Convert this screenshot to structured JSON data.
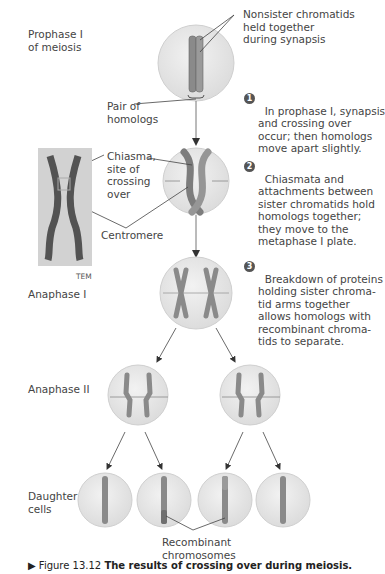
{
  "stages": {
    "prophase": "Prophase I\nof meiosis",
    "anaphase1": "Anaphase I",
    "anaphase2": "Anaphase II",
    "daughter": "Daughter\ncells"
  },
  "labels": {
    "nonsister": "Nonsister chromatids\nheld together\nduring synapsis",
    "pair_homologs": "Pair of\nhomologs",
    "chiasma": "Chiasma,\nsite of\ncrossing\nover",
    "centromere": "Centromere",
    "tem": "TEM",
    "recombinant": "Recombinant\nchromosomes"
  },
  "steps": [
    {
      "num": "1",
      "text": "In prophase I, synapsis\nand crossing over\noccur; then homologs\nmove apart slightly."
    },
    {
      "num": "2",
      "text": "Chiasmata and\nattachments between\nsister chromatids hold\nhomologs together;\nthey move to the\nmetaphase I plate."
    },
    {
      "num": "3",
      "text": "Breakdown of proteins\nholding sister chroma-\ntid arms together\nallows homologs with\nrecombinant chroma-\ntids to separate."
    }
  ],
  "caption": {
    "prefix": "▶ Figure 13.12 ",
    "bold": "The results of crossing over during meiosis."
  },
  "colors": {
    "cell_fill": "#e6e6e6",
    "cell_stroke": "#c9c9c9",
    "chromosome": "#8a8a8a",
    "chromosome_dark": "#6f6f6f",
    "line": "#555555",
    "badge": "#555555"
  }
}
